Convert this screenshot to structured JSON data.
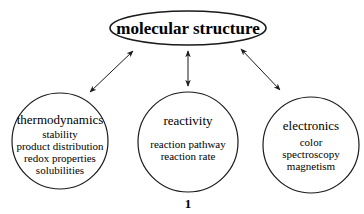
{
  "diagram": {
    "center": {
      "label": "molecular structure"
    },
    "nodes": [
      {
        "title": "thermodynamics",
        "items": [
          "stability",
          "product distribution",
          "redox properties",
          "solubilities"
        ]
      },
      {
        "title": "reactivity",
        "items": [
          "reaction pathway",
          "reaction rate"
        ]
      },
      {
        "title": "electronics",
        "items": [
          "color",
          "spectroscopy",
          "magnetism"
        ]
      }
    ],
    "figure_label": "1",
    "edges": [
      {
        "from": "molecular structure",
        "to": "thermodynamics",
        "type": "bidirectional"
      },
      {
        "from": "molecular structure",
        "to": "reactivity",
        "type": "bidirectional"
      },
      {
        "from": "molecular structure",
        "to": "electronics",
        "type": "bidirectional"
      }
    ]
  }
}
